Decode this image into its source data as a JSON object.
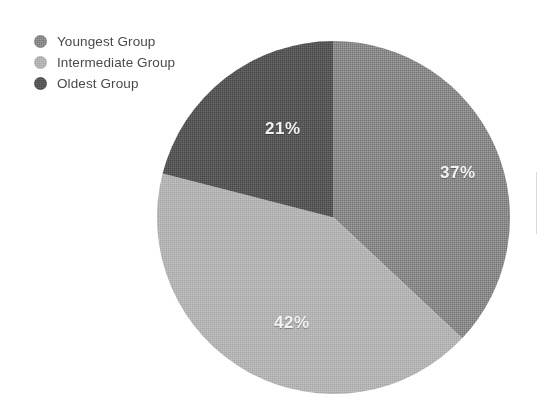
{
  "chart_data": {
    "type": "pie",
    "title": "",
    "subtitle": "",
    "xlabel": "",
    "ylabel": "",
    "grid": false,
    "legend_position": "top-left",
    "value_unit": "%",
    "categories": [
      "Youngest Group",
      "Intermediate Group",
      "Oldest Group"
    ],
    "values": [
      37,
      42,
      21
    ],
    "colors": [
      "#8a8a8a",
      "#b4b4b4",
      "#585858"
    ],
    "data_labels": [
      "37%",
      "42%",
      "21%"
    ],
    "start_angle_deg": 0,
    "direction": "clockwise",
    "total": 100,
    "slices": [
      {
        "name": "Youngest Group",
        "value": 37,
        "label": "37%",
        "color": "#8a8a8a",
        "start_angle_deg": 0,
        "end_angle_deg": 133.2
      },
      {
        "name": "Intermediate Group",
        "value": 42,
        "label": "42%",
        "color": "#b4b4b4",
        "start_angle_deg": 133.2,
        "end_angle_deg": 284.4
      },
      {
        "name": "Oldest Group",
        "value": 21,
        "label": "21%",
        "color": "#585858",
        "start_angle_deg": 284.4,
        "end_angle_deg": 360
      }
    ]
  },
  "legend": {
    "items": [
      {
        "label": "Youngest Group",
        "color": "#8a8a8a",
        "marker": "circle-marker-icon"
      },
      {
        "label": "Intermediate Group",
        "color": "#b4b4b4",
        "marker": "circle-marker-icon"
      },
      {
        "label": "Oldest Group",
        "color": "#585858",
        "marker": "circle-marker-icon"
      }
    ]
  },
  "canvas": {
    "background_color": "#ffffff",
    "label_text_color": "#f2f2f2",
    "legend_text_color": "#4a4a4a"
  }
}
